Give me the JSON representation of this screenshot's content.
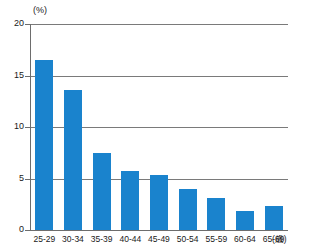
{
  "chart_data": {
    "type": "bar",
    "title": "",
    "subtitle": "",
    "xlabel": "(歳)",
    "ylabel": "(%)",
    "categories": [
      "25-29",
      "30-34",
      "35-39",
      "40-44",
      "45-49",
      "50-54",
      "55-59",
      "60-64",
      "65-69"
    ],
    "values": [
      16.5,
      13.6,
      7.5,
      5.7,
      5.3,
      4.0,
      3.1,
      1.8,
      2.3
    ],
    "series": [
      {
        "name": "",
        "values": [
          16.5,
          13.6,
          7.5,
          5.7,
          5.3,
          4.0,
          3.1,
          1.8,
          2.3
        ]
      }
    ],
    "ylim": [
      0,
      20
    ],
    "yticks": [
      0,
      5,
      10,
      15,
      20
    ],
    "ytick_labels": [
      "0",
      "5",
      "10",
      "15",
      "20"
    ],
    "grid": true,
    "grid_axis": "y",
    "legend": false,
    "legend_position": "none",
    "bar_color": "#1a83cd",
    "axis_color": "#6d6d6d",
    "gridline_color": "#7a7a7a",
    "text_color": "#1a1a1a",
    "background_color": "#ffffff"
  },
  "axes": {
    "y_unit": "(%)",
    "x_unit": "(歳)"
  }
}
